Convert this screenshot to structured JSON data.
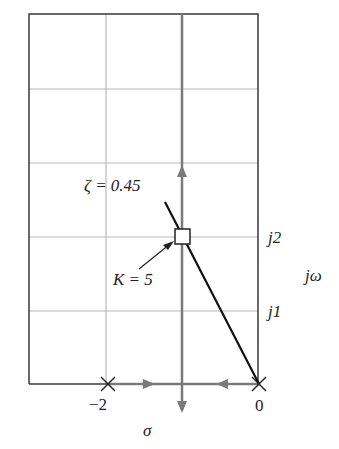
{
  "diagram": {
    "type": "root-locus",
    "labels": {
      "zeta": "ζ = 0.45",
      "gain": "K = 5",
      "j2": "j2",
      "j1": "j1",
      "jw": "jω",
      "sigma": "σ",
      "neg2": "−2",
      "zero": "0"
    },
    "poles": [
      {
        "real": 0,
        "imag": 0,
        "marker": "x"
      },
      {
        "real": -2,
        "imag": 0,
        "marker": "x"
      }
    ],
    "operating_point": {
      "real": -1,
      "imag": 2,
      "gain": 5,
      "damping_ratio": 0.45,
      "marker": "square"
    },
    "colors": {
      "axis": "#7a7a7a",
      "grid": "#b5b5b5",
      "border": "#333333",
      "zeta_line": "#111111",
      "text": "#222222"
    }
  }
}
